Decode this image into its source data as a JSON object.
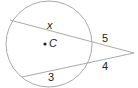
{
  "diagram": {
    "labels": {
      "x": "x",
      "center": "C",
      "outer_top": "5",
      "outer_bottom": "4",
      "inner_bottom": "3"
    },
    "colors": {
      "stroke": "#aaaaaa",
      "text": "#222222"
    }
  }
}
